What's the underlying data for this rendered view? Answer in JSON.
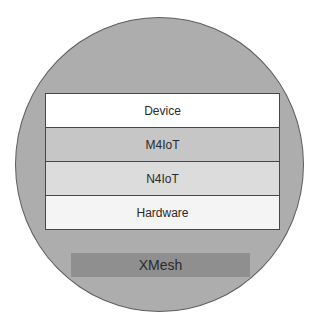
{
  "diagram": {
    "type": "layered-stack-in-circle",
    "container": {
      "shape": "circle",
      "fill": "#adadad",
      "border": "#5e5e5e"
    },
    "layers": [
      {
        "label": "Device",
        "fill": "#ffffff"
      },
      {
        "label": "M4IoT",
        "fill": "#c6c6c6"
      },
      {
        "label": "N4IoT",
        "fill": "#dcdcdc"
      },
      {
        "label": "Hardware",
        "fill": "#f4f4f4"
      }
    ],
    "base": {
      "label": "XMesh",
      "fill": "#8f8f8f"
    }
  }
}
